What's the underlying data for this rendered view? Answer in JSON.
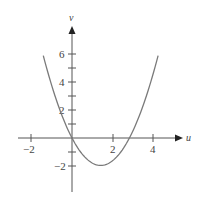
{
  "chart_data": {
    "type": "line",
    "title": "",
    "xlabel": "u",
    "ylabel": "v",
    "xlim": [
      -2.4,
      4.8
    ],
    "ylim": [
      -3.4,
      7.6
    ],
    "grid": false,
    "legend": null,
    "x_ticks": [
      -2,
      2,
      4
    ],
    "x_tick_labels": [
      "−2",
      "2",
      "4"
    ],
    "x_minor_ticks": [],
    "y_ticks": [
      -2,
      2,
      4,
      6
    ],
    "y_tick_labels": [
      "−2",
      "2",
      "4",
      "6"
    ],
    "y_minor_ticks": [
      -1,
      1,
      3,
      5
    ],
    "series": [
      {
        "name": "v(u)",
        "description": "Upward parabola through origin, vertex near (1.4, −1.96), zeros at u=0 and u≈2.8",
        "color": "#777777",
        "x": [
          -1.4,
          -1.0,
          -0.5,
          0,
          0.5,
          1.0,
          1.4,
          2.0,
          2.5,
          2.8,
          3.0,
          3.5,
          4.0,
          4.2
        ],
        "values": [
          5.88,
          3.8,
          1.65,
          0,
          -1.15,
          -1.8,
          -1.96,
          -1.6,
          -0.75,
          0,
          0.6,
          2.45,
          4.8,
          5.88
        ]
      }
    ]
  },
  "labels": {
    "x_axis": "u",
    "y_axis": "v",
    "x_tick_neg2": "−2",
    "x_tick_2": "2",
    "x_tick_4": "4",
    "y_tick_6": "6",
    "y_tick_4": "4",
    "y_tick_2": "2",
    "y_tick_neg2": "−2"
  },
  "colors": {
    "axis": "#444444",
    "curve": "#777777"
  }
}
